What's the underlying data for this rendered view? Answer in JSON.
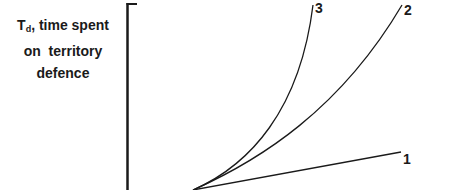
{
  "diagram": {
    "y_axis_label": {
      "symbol": "T",
      "subscript": "d",
      "line1_rest": ", time spent",
      "line2": "on  territory",
      "line3": "defence"
    },
    "curves": [
      {
        "id": "1",
        "label": "1",
        "shape": "straight line, low slope"
      },
      {
        "id": "2",
        "label": "2",
        "shape": "convex curve, moderate increase"
      },
      {
        "id": "3",
        "label": "3",
        "shape": "convex curve, steep increase"
      }
    ],
    "colors": {
      "line": "#1a1a1a",
      "background": "#ffffff"
    }
  }
}
